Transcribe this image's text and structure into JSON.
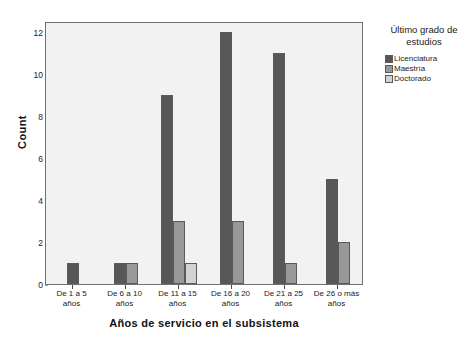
{
  "chart_data": {
    "type": "bar",
    "title": "",
    "xlabel": "Años de servicio en el subsistema",
    "ylabel": "Count",
    "categories": [
      "De 1 a 5 años",
      "De 6 a 10 años",
      "De 11 a 15 años",
      "De 16 a 20 años",
      "De 21 a 25 años",
      "De 26 o más años"
    ],
    "series": [
      {
        "name": "Licenciatura",
        "color": "#575757",
        "values": [
          1,
          1,
          9,
          12,
          11,
          5
        ]
      },
      {
        "name": "Maestría",
        "color": "#989898",
        "values": [
          0,
          1,
          3,
          3,
          1,
          2
        ]
      },
      {
        "name": "Doctorado",
        "color": "#d2d2d2",
        "values": [
          0,
          0,
          1,
          0,
          0,
          0
        ]
      }
    ],
    "ylim": [
      0,
      12.5
    ],
    "yticks": [
      0,
      2,
      4,
      6,
      8,
      10,
      12
    ],
    "grid": false,
    "legend_position": "right",
    "legend_title": "Último grado de estudios"
  },
  "legend": {
    "title_line1": "Último grado de",
    "title_line2": "estudios"
  },
  "axes": {
    "y_label": "Count",
    "x_label": "Años de servicio en el subsistema"
  },
  "x_labels": [
    {
      "line1": "De 1 a 5",
      "line2": "años"
    },
    {
      "line1": "De 6 a 10",
      "line2": "años"
    },
    {
      "line1": "De 11 a 15",
      "line2": "años"
    },
    {
      "line1": "De 16 a 20",
      "line2": "años"
    },
    {
      "line1": "De 21 a 25",
      "line2": "años"
    },
    {
      "line1": "De 26 o más",
      "line2": "años"
    }
  ]
}
